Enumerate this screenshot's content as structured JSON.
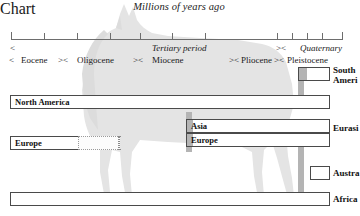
{
  "title": "Millions of years ago",
  "axis": {
    "ticks_px": [
      11,
      44,
      77,
      110,
      140,
      172,
      205,
      277,
      292,
      307,
      322,
      337
    ],
    "line_from_px": 11,
    "line_to_px": 342
  },
  "periods": {
    "row1": [
      {
        "label": "Tertiary period",
        "italic": true,
        "left_px": 152
      },
      {
        "label": "Quaternary",
        "italic": true,
        "left_px": 300
      }
    ],
    "row1_brackets": [
      {
        "mark": "<",
        "left_px": 10
      },
      {
        "mark": "><",
        "left_px": 276
      }
    ],
    "row2": [
      {
        "label": "Eocene",
        "italic": false,
        "left_px": 21
      },
      {
        "label": "Oligocene",
        "italic": false,
        "left_px": 77
      },
      {
        "label": "Miocene",
        "italic": false,
        "left_px": 152
      },
      {
        "label": "Pliocene",
        "italic": false,
        "left_px": 241
      },
      {
        "label": "Pleistocene",
        "italic": false,
        "left_px": 287
      }
    ],
    "row2_brackets": [
      {
        "mark": "<",
        "left_px": 9
      },
      {
        "mark": "><",
        "left_px": 58
      },
      {
        "mark": "><",
        "left_px": 133
      },
      {
        "mark": "><",
        "left_px": 229
      },
      {
        "mark": "><",
        "left_px": 274
      }
    ]
  },
  "chart_data": {
    "type": "range-bar",
    "title": "Millions of years ago",
    "xlabel": "",
    "ylabel": "",
    "axis_direction": "oldest-left-to-youngest-right",
    "bars": [
      {
        "name": "South America",
        "left_px": 298,
        "width_px": 32,
        "top_px": 5,
        "fill_px": 8,
        "style": "solid"
      },
      {
        "name": "North America",
        "left_px": 10,
        "width_px": 320,
        "top_px": 33,
        "fill_px": 0,
        "style": "solid"
      },
      {
        "name": "Asia",
        "left_px": 186,
        "width_px": 144,
        "top_px": 57,
        "fill_px": 6,
        "style": "solid"
      },
      {
        "name": "Europe (late)",
        "left_px": 186,
        "width_px": 144,
        "top_px": 71,
        "fill_px": 6,
        "style": "solid"
      },
      {
        "name": "Europe (early)",
        "left_px": 10,
        "width_px": 110,
        "top_px": 74,
        "fill_px": 0,
        "style": "dotted-tail",
        "solid_px": 68
      },
      {
        "name": "Australia",
        "left_px": 310,
        "width_px": 20,
        "top_px": 104,
        "fill_px": 0,
        "style": "solid"
      },
      {
        "name": "Africa",
        "left_px": 10,
        "width_px": 320,
        "top_px": 130,
        "fill_px": 0,
        "style": "solid"
      }
    ],
    "connectors": [
      {
        "name": "south-america-stem",
        "left_px": 298,
        "top_px": 5,
        "height_px": 30
      },
      {
        "name": "asia-europe-stem",
        "left_px": 186,
        "top_px": 50,
        "height_px": 40
      },
      {
        "name": "australia-stem",
        "left_px": 298,
        "top_px": 85,
        "height_px": 32
      },
      {
        "name": "africa-stem",
        "left_px": 298,
        "top_px": 104,
        "height_px": 28
      }
    ],
    "right_labels": [
      {
        "text_lines": [
          "South",
          "Ameri"
        ],
        "top_px": 3,
        "left_px": 333
      },
      {
        "text_lines": [
          "Eurasi"
        ],
        "top_px": 61,
        "left_px": 333
      },
      {
        "text_lines": [
          "Austra"
        ],
        "top_px": 106,
        "left_px": 333
      },
      {
        "text_lines": [
          "Africa"
        ],
        "top_px": 132,
        "left_px": 333
      }
    ]
  },
  "colors": {
    "box_border": "#4a4a4a",
    "connector_gray": "#b4b4b4",
    "silhouette": "#e3e3e3",
    "axis": "#6d6d6d",
    "text": "#1a1a1a"
  }
}
